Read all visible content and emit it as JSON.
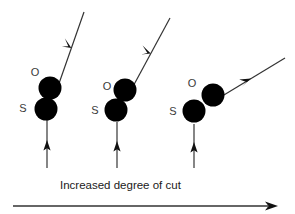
{
  "figure": {
    "caption": "Increased degree of cut",
    "background_color": "#ffffff",
    "atom_fill_color": "#000000",
    "label_color": "#3a3a3a",
    "arrow_color": "#333333",
    "width": 295,
    "height": 214
  },
  "groups": [
    {
      "id": "group-1",
      "label_o": "O",
      "label_s": "S",
      "o_circle": {
        "cx": 50,
        "cy": 88,
        "r": 11.5
      },
      "s_circle": {
        "cx": 46,
        "cy": 109,
        "r": 11.5
      },
      "o_label_pos": {
        "x": 35,
        "y": 76
      },
      "s_label_pos": {
        "x": 23,
        "y": 112
      },
      "diagonal_arrow": {
        "x1": 56,
        "y1": 92,
        "x2": 84,
        "y2": 12,
        "head_t": 0.55
      },
      "vertical_arrow": {
        "x": 47,
        "y1": 168,
        "y2": 120,
        "head_t": 0.52
      }
    },
    {
      "id": "group-2",
      "label_o": "O",
      "label_s": "S",
      "o_circle": {
        "cx": 125,
        "cy": 90,
        "r": 11.5
      },
      "s_circle": {
        "cx": 116,
        "cy": 110,
        "r": 11.5
      },
      "o_label_pos": {
        "x": 107,
        "y": 90
      },
      "s_label_pos": {
        "x": 95,
        "y": 114
      },
      "diagonal_arrow": {
        "x1": 130,
        "y1": 92,
        "x2": 170,
        "y2": 18,
        "head_t": 0.52
      },
      "vertical_arrow": {
        "x": 117,
        "y1": 168,
        "y2": 122,
        "head_t": 0.52
      }
    },
    {
      "id": "group-3",
      "label_o": "O",
      "label_s": "S",
      "o_circle": {
        "cx": 213,
        "cy": 95,
        "r": 11.5
      },
      "s_circle": {
        "cx": 194,
        "cy": 111,
        "r": 11.5
      },
      "o_label_pos": {
        "x": 192,
        "y": 87
      },
      "s_label_pos": {
        "x": 173,
        "y": 115
      },
      "diagonal_arrow": {
        "x1": 214,
        "y1": 101,
        "x2": 285,
        "y2": 58,
        "head_t": 0.52
      },
      "vertical_arrow": {
        "x": 194,
        "y1": 168,
        "y2": 124,
        "head_t": 0.52
      }
    }
  ],
  "caption_pos": {
    "x": 60,
    "y": 189
  },
  "axis_arrow": {
    "x1": 13,
    "y1": 206,
    "x2": 272,
    "y2": 206
  }
}
